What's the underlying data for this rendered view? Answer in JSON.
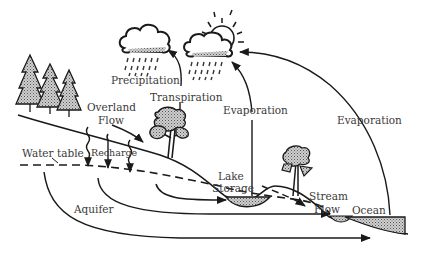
{
  "diagram": {
    "colors": {
      "ink": "#1a1a1a",
      "fill_stipple": "#9a9a9a",
      "text": "#3a3a3a",
      "background": "#ffffff"
    },
    "labels": {
      "precipitation": "Precipitation",
      "transpiration": "Transpiration",
      "evaporation_lake": "Evaporation",
      "evaporation_ocean": "Evaporation",
      "overland_flow_1": "Overland",
      "overland_flow_2": "Flow",
      "recharge": "Recharge",
      "water_table": "Water table",
      "lake_storage_1": "Lake",
      "lake_storage_2": "Storage",
      "stream_flow_1": "Stream",
      "stream_flow_2": "Flow",
      "aquifer": "Aquifer",
      "ocean": "Ocean"
    },
    "icons": [
      "rain-cloud-icon",
      "sun-cloud-icon",
      "pine-tree-icon",
      "deciduous-tree-icon"
    ]
  }
}
